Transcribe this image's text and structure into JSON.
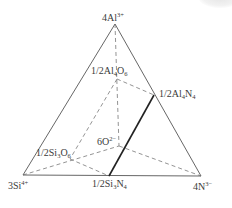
{
  "diagram": {
    "type": "compositional-triangle",
    "colors": {
      "outline": "#555555",
      "dashed": "#777777",
      "solid_join": "#222222",
      "text": "#3a3a3a"
    },
    "vertices": {
      "top": {
        "label": "4Al",
        "charge": "3+",
        "x": 115,
        "y": 24
      },
      "left": {
        "label": "3Si",
        "charge": "4+",
        "x": 23,
        "y": 175
      },
      "right": {
        "label": "4N",
        "charge": "3−",
        "x": 201,
        "y": 176
      }
    },
    "points": {
      "al4o6": {
        "prefix": "1/2Al",
        "sub1": "4",
        "mid": "O",
        "sub2": "6",
        "x": 117,
        "y": 79
      },
      "al4n4": {
        "prefix": "1/2Al",
        "sub1": "4",
        "mid": "N",
        "sub2": "4",
        "x": 154,
        "y": 95
      },
      "o6": {
        "label": "6O",
        "charge": "2−",
        "x": 119,
        "y": 146
      },
      "si3o6": {
        "prefix": "1/2Si",
        "sub1": "3",
        "mid": "O",
        "sub2": "6",
        "x": 70,
        "y": 159
      },
      "si3n4": {
        "prefix": "1/2Si",
        "sub1": "3",
        "mid": "N",
        "sub2": "4",
        "x": 109,
        "y": 176
      }
    },
    "solid_edges": [
      [
        "top",
        "left"
      ],
      [
        "top",
        "right"
      ],
      [
        "left",
        "right"
      ]
    ],
    "dashed_edges": [
      [
        "top",
        "o6"
      ],
      [
        "al4o6",
        "al4n4"
      ],
      [
        "al4o6",
        "si3o6"
      ],
      [
        "left",
        "o6"
      ],
      [
        "o6",
        "right"
      ],
      [
        "si3o6",
        "si3n4"
      ]
    ],
    "bold_edges": [
      [
        "al4n4",
        "si3n4"
      ]
    ]
  }
}
